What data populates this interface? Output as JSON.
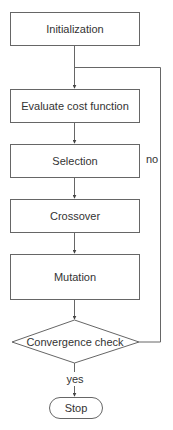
{
  "diagram": {
    "type": "flowchart",
    "colors": {
      "stroke": "#666666",
      "text": "#333333",
      "background": "#ffffff"
    },
    "nodes": [
      {
        "id": "init",
        "shape": "rect",
        "label": "Initialization"
      },
      {
        "id": "eval",
        "shape": "rect",
        "label": "Evaluate cost function"
      },
      {
        "id": "select",
        "shape": "rect",
        "label": "Selection"
      },
      {
        "id": "cross",
        "shape": "rect",
        "label": "Crossover"
      },
      {
        "id": "mutate",
        "shape": "rect",
        "label": "Mutation"
      },
      {
        "id": "check",
        "shape": "diamond",
        "label": "Convergence check"
      },
      {
        "id": "stop",
        "shape": "terminator",
        "label": "Stop"
      }
    ],
    "edges": [
      {
        "from": "init",
        "to": "eval",
        "label": ""
      },
      {
        "from": "eval",
        "to": "select",
        "label": ""
      },
      {
        "from": "select",
        "to": "cross",
        "label": ""
      },
      {
        "from": "cross",
        "to": "mutate",
        "label": ""
      },
      {
        "from": "mutate",
        "to": "check",
        "label": ""
      },
      {
        "from": "check",
        "to": "eval",
        "label": "no"
      },
      {
        "from": "check",
        "to": "stop",
        "label": "yes"
      }
    ],
    "edge_labels": {
      "no": "no",
      "yes": "yes"
    }
  }
}
